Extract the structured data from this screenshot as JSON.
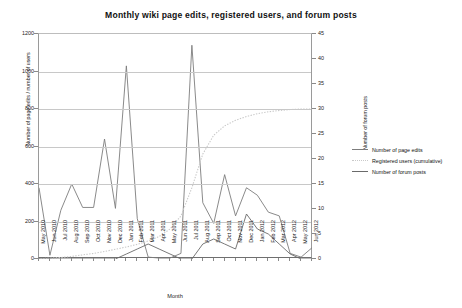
{
  "chart_data": {
    "type": "line",
    "title": "Monthly wiki page edits, registered users, and forum posts",
    "xlabel": "Month",
    "ylabel": "Number of page edits / number of users",
    "y2label": "Number of forum posts",
    "ylim": [
      0,
      1200
    ],
    "y2lim": [
      0,
      45
    ],
    "yticks": [
      0,
      200,
      400,
      600,
      800,
      1000,
      1200
    ],
    "y2ticks": [
      0,
      5,
      10,
      15,
      20,
      25,
      30,
      35,
      40,
      45
    ],
    "grid": true,
    "legend_position": "right",
    "categories": [
      "May 2010",
      "Jun 2010",
      "Jul 2010",
      "Aug 2010",
      "Sep 2010",
      "Oct 2010",
      "Nov 2010",
      "Dec 2010",
      "Jan 2011",
      "Feb 2011",
      "Mar 2011",
      "Apr 2011",
      "May 2011",
      "Jun 2011",
      "Jul 2011",
      "Aug 2011",
      "Sep 2011",
      "Oct 2011",
      "Nov 2011",
      "Dec 2011",
      "Jan 2012",
      "Feb 2012",
      "Mar 2012",
      "Apr 2012",
      "May 2012",
      "Jun 2012"
    ],
    "series": [
      {
        "name": "Number of page edits",
        "axis": "left",
        "color": "#7d7d7d",
        "style": "solid",
        "values": [
          380,
          20,
          260,
          400,
          275,
          275,
          640,
          270,
          1030,
          215,
          10,
          5,
          5,
          30,
          1140,
          300,
          190,
          450,
          230,
          380,
          340,
          250,
          230,
          30,
          10,
          60
        ]
      },
      {
        "name": "Registered users (cumulative)",
        "axis": "left",
        "color": "#c9c9c9",
        "style": "dotted",
        "values": [
          2,
          4,
          8,
          14,
          22,
          30,
          40,
          52,
          64,
          78,
          96,
          120,
          160,
          230,
          380,
          560,
          660,
          710,
          740,
          760,
          775,
          785,
          792,
          797,
          800,
          800
        ]
      },
      {
        "name": "Number of forum posts",
        "axis": "right",
        "color": "#6a6a6a",
        "style": "solid",
        "values": [
          0,
          0,
          0,
          0,
          0,
          0,
          0,
          0,
          1,
          2,
          3,
          2,
          1,
          0,
          0,
          3,
          4,
          3,
          2,
          9,
          6,
          5,
          3,
          1,
          0,
          0
        ]
      }
    ]
  }
}
